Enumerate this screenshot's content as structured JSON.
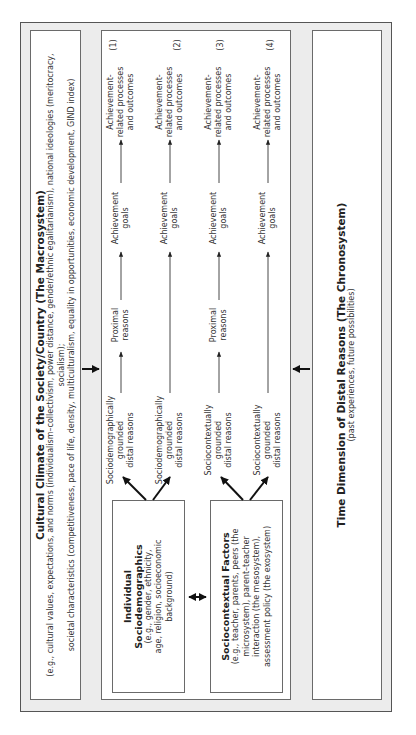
{
  "macrosystem": {
    "title": "Cultural Climate of the Society/Country (The Macrosystem)",
    "line1": "(e.g., cultural values, expectations, and norms (individualism–collectivism, power distance, gender/ethnic egalitarianism), national ideologies (meritocracy, socialism);",
    "line2": "societal characteristics (competitiveness, pace of life, density, multiculturalism, equality in opportunities, economic development, GIND index)"
  },
  "chronosystem": {
    "title": "Time Dimension of Distal Reasons (The Chronosystem)",
    "subtitle": "(past experiences, future possibilities)"
  },
  "factors": [
    {
      "title_line1": "Individual",
      "title_line2": "Sociodemographics",
      "lines": [
        "(e.g., gender, ethnicity,",
        "age, religion, socioeconomic",
        "background)"
      ]
    },
    {
      "title_line1": "Sociocontextual Factors",
      "lines": [
        "(e.g., teacher, parents, peers (the",
        "microsystem), parent–teacher",
        "interaction (the mesosystem),",
        "assessment policy (the exosystem)"
      ]
    }
  ],
  "pathways": [
    {
      "number": "(1)",
      "distal": [
        "Sociodemographically",
        "grounded",
        "distal reasons"
      ],
      "proximal": [
        "Proximal",
        "reasons"
      ],
      "goals": [
        "Achievement",
        "goals"
      ],
      "outcome": [
        "Achievement-",
        "related processes",
        "and outcomes"
      ]
    },
    {
      "number": "(2)",
      "distal": [
        "Sociodemographically",
        "grounded",
        "distal reasons"
      ],
      "proximal": null,
      "goals": [
        "Achievement",
        "goals"
      ],
      "outcome": [
        "Achievement-",
        "related processes",
        "and outcomes"
      ]
    },
    {
      "number": "(3)",
      "distal": [
        "Sociocontextually",
        "grounded",
        "distal reasons"
      ],
      "proximal": [
        "Proximal",
        "reasons"
      ],
      "goals": [
        "Achievement",
        "goals"
      ],
      "outcome": [
        "Achievement-",
        "related processes",
        "and outcomes"
      ]
    },
    {
      "number": "(4)",
      "distal": [
        "Sociocontextually",
        "grounded",
        "distal reasons"
      ],
      "proximal": null,
      "goals": [
        "Achievement",
        "goals"
      ],
      "outcome": [
        "Achievement-",
        "related processes",
        "and outcomes"
      ]
    }
  ],
  "colors": {
    "frame_fill": "#ececec",
    "box_fill": "#ffffff",
    "stroke": "#222222"
  }
}
